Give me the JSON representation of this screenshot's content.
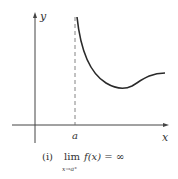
{
  "figure": {
    "y_axis_label": "y",
    "x_axis_label": "x",
    "asymptote_label": "a",
    "caption_number": "(i)",
    "caption_lim": "lim",
    "caption_expr": "f(x) = ∞",
    "caption_sub": "x→a⁺"
  },
  "colors": {
    "ink": "#333333",
    "curve": "#2a2a2a"
  }
}
